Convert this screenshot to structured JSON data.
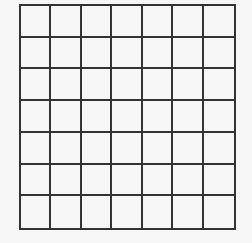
{
  "grid": {
    "rows": 7,
    "cols": 7,
    "line_color": "#333333",
    "cell_color": "#f7f7f7"
  }
}
